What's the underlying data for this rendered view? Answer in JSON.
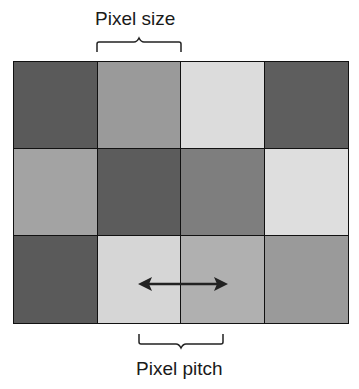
{
  "labels": {
    "top": "Pixel size",
    "bottom": "Pixel pitch"
  },
  "grid": {
    "rows": 3,
    "cols": 4,
    "cells": [
      [
        "#5a5a5a",
        "#9a9a9a",
        "#dcdcdc",
        "#5e5e5e"
      ],
      [
        "#a3a3a3",
        "#5c5c5c",
        "#7e7e7e",
        "#dedede"
      ],
      [
        "#5a5a5a",
        "#d6d6d6",
        "#b0b0b0",
        "#9a9a9a"
      ]
    ]
  },
  "annotations": {
    "top_brace": "pixel-size-brace",
    "bottom_brace": "pixel-pitch-brace",
    "arrow": "double-headed-arrow"
  }
}
